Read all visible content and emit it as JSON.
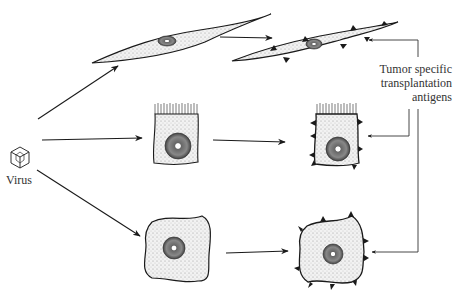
{
  "diagram": {
    "type": "biology-illustration",
    "labels": {
      "virus": "Virus",
      "antigens_line1": "Tumor specific",
      "antigens_line2": "transplantation",
      "antigens_line3": "antigens"
    },
    "nodes": [
      {
        "id": "virus",
        "label": "Virus",
        "shape": "icosahedron"
      },
      {
        "id": "fibroblast-normal",
        "shape": "spindle cell"
      },
      {
        "id": "epithelial-normal",
        "shape": "columnar cell with microvilli"
      },
      {
        "id": "round-normal",
        "shape": "irregular rounded cell"
      },
      {
        "id": "fibroblast-transformed",
        "shape": "spindle cell with surface antigens"
      },
      {
        "id": "epithelial-transformed",
        "shape": "columnar cell with surface antigens"
      },
      {
        "id": "round-transformed",
        "shape": "rounded cell with surface antigens"
      }
    ],
    "edges": [
      {
        "from": "virus",
        "to": "fibroblast-normal"
      },
      {
        "from": "virus",
        "to": "epithelial-normal"
      },
      {
        "from": "virus",
        "to": "round-normal"
      },
      {
        "from": "fibroblast-normal",
        "to": "fibroblast-transformed"
      },
      {
        "from": "epithelial-normal",
        "to": "epithelial-transformed"
      },
      {
        "from": "round-normal",
        "to": "round-transformed"
      },
      {
        "from": "antigens-label",
        "to": "fibroblast-transformed"
      },
      {
        "from": "antigens-label",
        "to": "epithelial-transformed"
      },
      {
        "from": "antigens-label",
        "to": "round-transformed"
      }
    ],
    "colors": {
      "ink": "#1a1a1a",
      "cell_fill": "#e4e4e4",
      "nucleus_fill": "#9a9a9a"
    }
  }
}
